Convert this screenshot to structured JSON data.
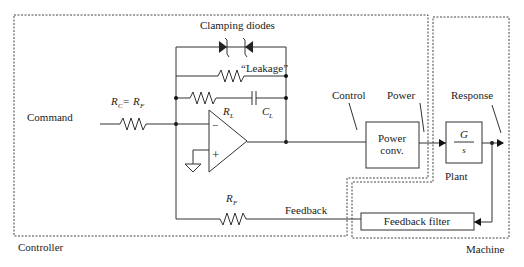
{
  "regions": {
    "controller": "Controller",
    "machine": "Machine"
  },
  "labels": {
    "command": "Command",
    "rc_eq_rf": {
      "r1": "R",
      "s1": "C",
      "eq": "= ",
      "r2": "R",
      "s2": "F"
    },
    "clamping_diodes": "Clamping diodes",
    "leakage": "“Leakage”",
    "rl": {
      "r": "R",
      "s": "L"
    },
    "cl": {
      "c": "C",
      "s": "L"
    },
    "rf": {
      "r": "R",
      "s": "F"
    },
    "minus": "−",
    "plus": "+",
    "control": "Control",
    "power": "Power",
    "response": "Response",
    "feedback": "Feedback",
    "plant": "Plant"
  },
  "blocks": {
    "power_conv": {
      "line1": "Power",
      "line2": "conv."
    },
    "plant": {
      "num": "G",
      "den": "s"
    },
    "feedback_filter": "Feedback filter"
  }
}
